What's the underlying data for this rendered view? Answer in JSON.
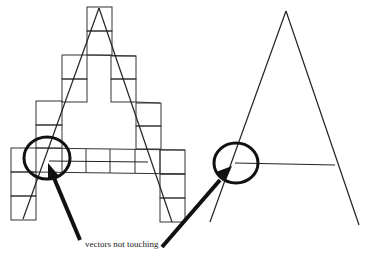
{
  "figure": {
    "caption": "vectors not touching",
    "colors": {
      "line": "#222222",
      "background": "#ffffff"
    },
    "left_panel": {
      "description": "letter A drawn with vector lines over a pixel grid"
    },
    "right_panel": {
      "description": "letter A drawn with vector lines only"
    }
  }
}
